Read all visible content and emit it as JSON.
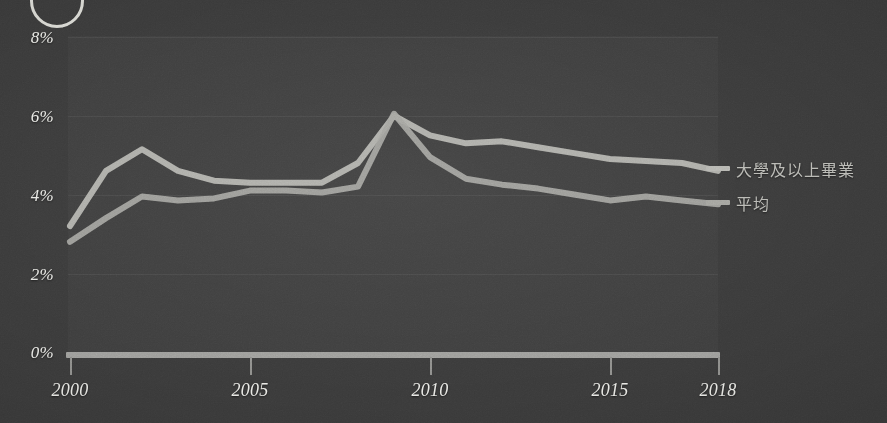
{
  "chart_data": {
    "type": "line",
    "title": "",
    "subtitle": "",
    "xlabel": "",
    "ylabel": "",
    "xlim": [
      2000,
      2018
    ],
    "ylim": [
      0,
      8
    ],
    "grid": true,
    "legend_position": "right",
    "y_ticks": [
      "0%",
      "2%",
      "4%",
      "6%",
      "8%"
    ],
    "y_tick_values": [
      0,
      2,
      4,
      6,
      8
    ],
    "x_ticks": [
      "2000",
      "2005",
      "2010",
      "2015",
      "2018"
    ],
    "x_tick_values": [
      2000,
      2005,
      2010,
      2015,
      2018
    ],
    "x": [
      2000,
      2001,
      2002,
      2003,
      2004,
      2005,
      2006,
      2007,
      2008,
      2009,
      2010,
      2011,
      2012,
      2013,
      2014,
      2015,
      2016,
      2017,
      2018
    ],
    "series": [
      {
        "name": "大學及以上畢業",
        "color": "#b6b6b1",
        "values": [
          3.2,
          4.6,
          5.15,
          4.6,
          4.35,
          4.3,
          4.3,
          4.3,
          4.8,
          6.0,
          5.5,
          5.3,
          5.35,
          5.2,
          5.05,
          4.9,
          4.85,
          4.8,
          4.6
        ]
      },
      {
        "name": "平均",
        "color": "#a3a39e",
        "values": [
          2.8,
          3.4,
          3.95,
          3.85,
          3.9,
          4.1,
          4.1,
          4.05,
          4.2,
          6.05,
          4.95,
          4.4,
          4.25,
          4.15,
          4.0,
          3.85,
          3.95,
          3.85,
          3.75
        ]
      }
    ],
    "legend": [
      {
        "label": "大學及以上畢業",
        "color": "#b6b6b1"
      },
      {
        "label": "平均",
        "color": "#a3a39e"
      }
    ]
  },
  "decor": {
    "corner_circle_name": "circle-outline",
    "background_color": "#3a3a3a",
    "axis_color": "#9d9d9a",
    "text_color": "#e8e8e4",
    "legend_text_color": "#b9b9b4"
  }
}
